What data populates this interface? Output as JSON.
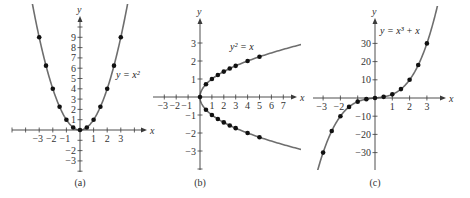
{
  "figure": {
    "panels": [
      "a",
      "b",
      "c"
    ]
  },
  "chart_data": [
    {
      "type": "scatter",
      "panel": "a",
      "caption": "(a)",
      "title": "",
      "equation": "y = x²",
      "xlabel": "x",
      "ylabel": "y",
      "x_ticks": [
        -3,
        -2,
        -1,
        1,
        2,
        3
      ],
      "y_ticks": [
        -3,
        -2,
        1,
        2,
        3,
        4,
        5,
        6,
        7,
        8,
        9
      ],
      "xlim": [
        -4.4,
        4.4
      ],
      "ylim": [
        -4,
        11
      ],
      "grid": false,
      "curve": "y = x^2",
      "points": [
        {
          "x": -3,
          "y": 9
        },
        {
          "x": -2.5,
          "y": 6.25
        },
        {
          "x": -2,
          "y": 4
        },
        {
          "x": -1.5,
          "y": 2.25
        },
        {
          "x": -1,
          "y": 1
        },
        {
          "x": -0.5,
          "y": 0.25
        },
        {
          "x": 0,
          "y": 0
        },
        {
          "x": 0.5,
          "y": 0.25
        },
        {
          "x": 1,
          "y": 1
        },
        {
          "x": 1.5,
          "y": 2.25
        },
        {
          "x": 2,
          "y": 4
        },
        {
          "x": 2.5,
          "y": 6.25
        },
        {
          "x": 3,
          "y": 9
        }
      ],
      "layout": {
        "ox": 80,
        "oy": 130,
        "sx": 13.6,
        "sy": 10.3,
        "xmin_px": 12,
        "xmax_px": 147,
        "ymin_px": 172,
        "ymax_px": 16,
        "eq_x": 116,
        "eq_y": 78,
        "cap_x": 80,
        "cap_y": 186
      }
    },
    {
      "type": "scatter",
      "panel": "b",
      "caption": "(b)",
      "title": "",
      "equation": "y² = x",
      "xlabel": "x",
      "ylabel": "y",
      "x_ticks": [
        -3,
        -2,
        -1,
        1,
        2,
        3,
        4,
        5,
        6,
        7
      ],
      "y_ticks": [
        -3,
        -2,
        -1,
        1,
        2,
        3
      ],
      "xlim": [
        -4,
        8
      ],
      "ylim": [
        -4,
        4
      ],
      "grid": false,
      "curve": "y^2 = x",
      "points": [
        {
          "x": 0,
          "y": 0
        },
        {
          "x": 0.5,
          "y": 0.71
        },
        {
          "x": 1,
          "y": 1
        },
        {
          "x": 1.5,
          "y": 1.22
        },
        {
          "x": 2,
          "y": 1.41
        },
        {
          "x": 2.5,
          "y": 1.58
        },
        {
          "x": 3,
          "y": 1.73
        },
        {
          "x": 4,
          "y": 2
        },
        {
          "x": 5,
          "y": 2.24
        },
        {
          "x": 0.5,
          "y": -0.71
        },
        {
          "x": 1,
          "y": -1
        },
        {
          "x": 1.5,
          "y": -1.22
        },
        {
          "x": 2,
          "y": -1.41
        },
        {
          "x": 2.5,
          "y": -1.58
        },
        {
          "x": 3,
          "y": -1.73
        },
        {
          "x": 4,
          "y": -2
        },
        {
          "x": 5,
          "y": -2.24
        }
      ],
      "layout": {
        "ox": 200,
        "oy": 97,
        "sx": 11.9,
        "sy": 18,
        "xmin_px": 153,
        "xmax_px": 297,
        "ymin_px": 170,
        "ymax_px": 18,
        "eq_x": 230,
        "eq_y": 50,
        "cap_x": 200,
        "cap_y": 186
      }
    },
    {
      "type": "scatter",
      "panel": "c",
      "caption": "(c)",
      "title": "",
      "equation": "y = x³ + x",
      "xlabel": "x",
      "ylabel": "y",
      "x_ticks": [
        -3,
        -2,
        1,
        2,
        3
      ],
      "y_ticks": [
        -30,
        -20,
        -10,
        10,
        20,
        30
      ],
      "xlim": [
        -3.8,
        4
      ],
      "ylim": [
        -40,
        40
      ],
      "grid": false,
      "curve": "y = x^3 + x",
      "points": [
        {
          "x": -3,
          "y": -30
        },
        {
          "x": -2.5,
          "y": -18.13
        },
        {
          "x": -2,
          "y": -10
        },
        {
          "x": -1.5,
          "y": -4.88
        },
        {
          "x": -1,
          "y": -2
        },
        {
          "x": -0.5,
          "y": -0.63
        },
        {
          "x": 0,
          "y": 0
        },
        {
          "x": 0.5,
          "y": 0.63
        },
        {
          "x": 1,
          "y": 2
        },
        {
          "x": 1.5,
          "y": 4.88
        },
        {
          "x": 2,
          "y": 10
        },
        {
          "x": 2.5,
          "y": 18.13
        },
        {
          "x": 3,
          "y": 30
        }
      ],
      "layout": {
        "ox": 375,
        "oy": 98,
        "sx": 17.3,
        "sy": 1.82,
        "xmin_px": 313,
        "xmax_px": 446,
        "ymin_px": 170,
        "ymax_px": 18,
        "eq_x": 380,
        "eq_y": 34,
        "cap_x": 375,
        "cap_y": 186
      }
    }
  ]
}
